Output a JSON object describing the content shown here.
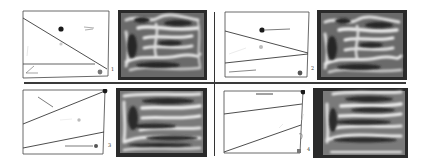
{
  "figure": {
    "panels": [
      {
        "label": "1",
        "position": "top-left"
      },
      {
        "label": "2",
        "position": "top-right"
      },
      {
        "label": "3",
        "position": "bottom-left"
      },
      {
        "label": "4",
        "position": "bottom-right"
      }
    ],
    "colors": {
      "line": "#3a3a3a",
      "dot_dark": "#1a1a1a",
      "dot_gray": "#777777",
      "dot_light": "#bbbbbb",
      "field_bg": "#2a2a2a",
      "field_light": "#e8e8e8"
    }
  }
}
